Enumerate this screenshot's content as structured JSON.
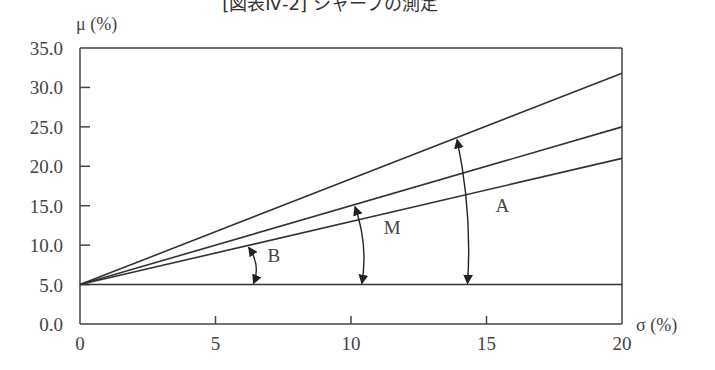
{
  "chart_data": {
    "type": "line",
    "title": "[図表Ⅳ-2] シャープの測定",
    "xlabel": "σ (%)",
    "ylabel": "μ (%)",
    "xlim": [
      0,
      20
    ],
    "ylim": [
      0,
      35
    ],
    "x_ticks": [
      "0",
      "5",
      "10",
      "15",
      "20"
    ],
    "y_ticks": [
      "0.0",
      "5.0",
      "10.0",
      "15.0",
      "20.0",
      "25.0",
      "30.0",
      "35.0"
    ],
    "grid": false,
    "series": [
      {
        "name": "A",
        "x": [
          0,
          20
        ],
        "values": [
          5.0,
          31.8
        ]
      },
      {
        "name": "M",
        "x": [
          0,
          20
        ],
        "values": [
          5.0,
          25.0
        ]
      },
      {
        "name": "B",
        "x": [
          0,
          20
        ],
        "values": [
          5.0,
          21.0
        ]
      },
      {
        "name": "risk-free",
        "x": [
          0,
          20
        ],
        "values": [
          5.0,
          5.0
        ]
      }
    ],
    "annotations": [
      {
        "label": "B",
        "type": "angle-arrow",
        "between": [
          "B",
          "risk-free"
        ],
        "at_x": 6.3
      },
      {
        "label": "M",
        "type": "angle-arrow",
        "between": [
          "M",
          "risk-free"
        ],
        "at_x": 10.3
      },
      {
        "label": "A",
        "type": "angle-arrow",
        "between": [
          "A",
          "risk-free"
        ],
        "at_x": 14.2
      }
    ]
  },
  "layout": {
    "plot_left": 80,
    "plot_right": 622,
    "plot_top": 48,
    "plot_bottom": 324
  }
}
